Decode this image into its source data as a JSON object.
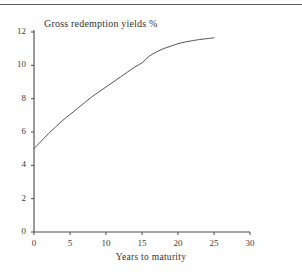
{
  "figure": {
    "title": "Gross redemption yields %",
    "xlabel": "Years to maturity",
    "top_rule": true
  },
  "chart_data": {
    "type": "line",
    "title": "Gross redemption yields %",
    "subtitle": "",
    "xlabel": "Years to maturity",
    "ylabel": "Gross redemption yields %",
    "xlim": [
      0,
      30
    ],
    "ylim": [
      0,
      12
    ],
    "xticks": [
      0,
      5,
      10,
      15,
      20,
      25,
      30
    ],
    "yticks": [
      0,
      2,
      4,
      6,
      8,
      10,
      12
    ],
    "xtick_labels": [
      "0",
      "5",
      "10",
      "15",
      "20",
      "25",
      "30"
    ],
    "ytick_labels": [
      "0",
      "2",
      "4",
      "6",
      "8",
      "10",
      "12"
    ],
    "grid": false,
    "legend": null,
    "series": [
      {
        "name": "Gross redemption yield curve",
        "color": "#555555",
        "x": [
          0,
          1,
          2,
          3,
          4,
          5,
          6,
          7,
          8,
          9,
          10,
          11,
          12,
          13,
          14,
          15,
          16,
          17,
          18,
          19,
          20,
          21,
          22,
          23,
          24,
          25
        ],
        "y": [
          5.0,
          5.45,
          5.9,
          6.3,
          6.7,
          7.05,
          7.4,
          7.75,
          8.1,
          8.4,
          8.7,
          9.0,
          9.3,
          9.6,
          9.9,
          10.15,
          10.55,
          10.8,
          11.0,
          11.15,
          11.3,
          11.4,
          11.48,
          11.55,
          11.6,
          11.65
        ]
      }
    ],
    "annotations": []
  }
}
